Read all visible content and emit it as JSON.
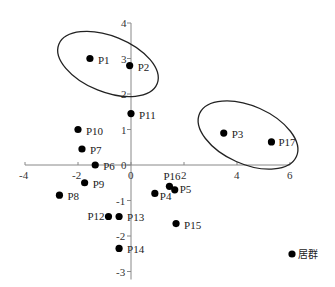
{
  "chart_data": {
    "type": "scatter",
    "title": "",
    "xlabel": "",
    "ylabel": "",
    "xlim": [
      -4,
      6
    ],
    "ylim": [
      -3,
      4
    ],
    "x_ticks": [
      "-4",
      "-2",
      "0",
      "2",
      "4",
      "6"
    ],
    "y_ticks": [
      "4",
      "3",
      "2",
      "1",
      "0",
      "-1",
      "-2",
      "-3"
    ],
    "grid": false,
    "legend": {
      "position": "bottom-right",
      "entries": [
        "居群"
      ]
    },
    "series": [
      {
        "name": "居群",
        "color": "#000000",
        "points": [
          {
            "label": "P1",
            "x": -1.55,
            "y": 3.0
          },
          {
            "label": "P2",
            "x": -0.05,
            "y": 2.8
          },
          {
            "label": "P3",
            "x": 3.5,
            "y": 0.9
          },
          {
            "label": "P4",
            "x": 0.9,
            "y": -0.8
          },
          {
            "label": "P5",
            "x": 1.65,
            "y": -0.7
          },
          {
            "label": "P6",
            "x": -1.35,
            "y": 0.0
          },
          {
            "label": "P7",
            "x": -1.85,
            "y": 0.45
          },
          {
            "label": "P8",
            "x": -2.7,
            "y": -0.85
          },
          {
            "label": "P9",
            "x": -1.75,
            "y": -0.5
          },
          {
            "label": "P10",
            "x": -2.0,
            "y": 1.0
          },
          {
            "label": "P11",
            "x": 0.0,
            "y": 1.45
          },
          {
            "label": "P12",
            "x": -0.85,
            "y": -1.45
          },
          {
            "label": "P13",
            "x": -0.45,
            "y": -1.45
          },
          {
            "label": "P14",
            "x": -0.45,
            "y": -2.35
          },
          {
            "label": "P15",
            "x": 1.7,
            "y": -1.65
          },
          {
            "label": "P16",
            "x": 1.45,
            "y": -0.6
          },
          {
            "label": "P17",
            "x": 5.3,
            "y": 0.65
          }
        ]
      }
    ],
    "annotations": [
      {
        "type": "ellipse",
        "encloses": [
          "P1",
          "P2"
        ]
      },
      {
        "type": "ellipse",
        "encloses": [
          "P3",
          "P17"
        ]
      }
    ]
  },
  "legend_label": "居群"
}
